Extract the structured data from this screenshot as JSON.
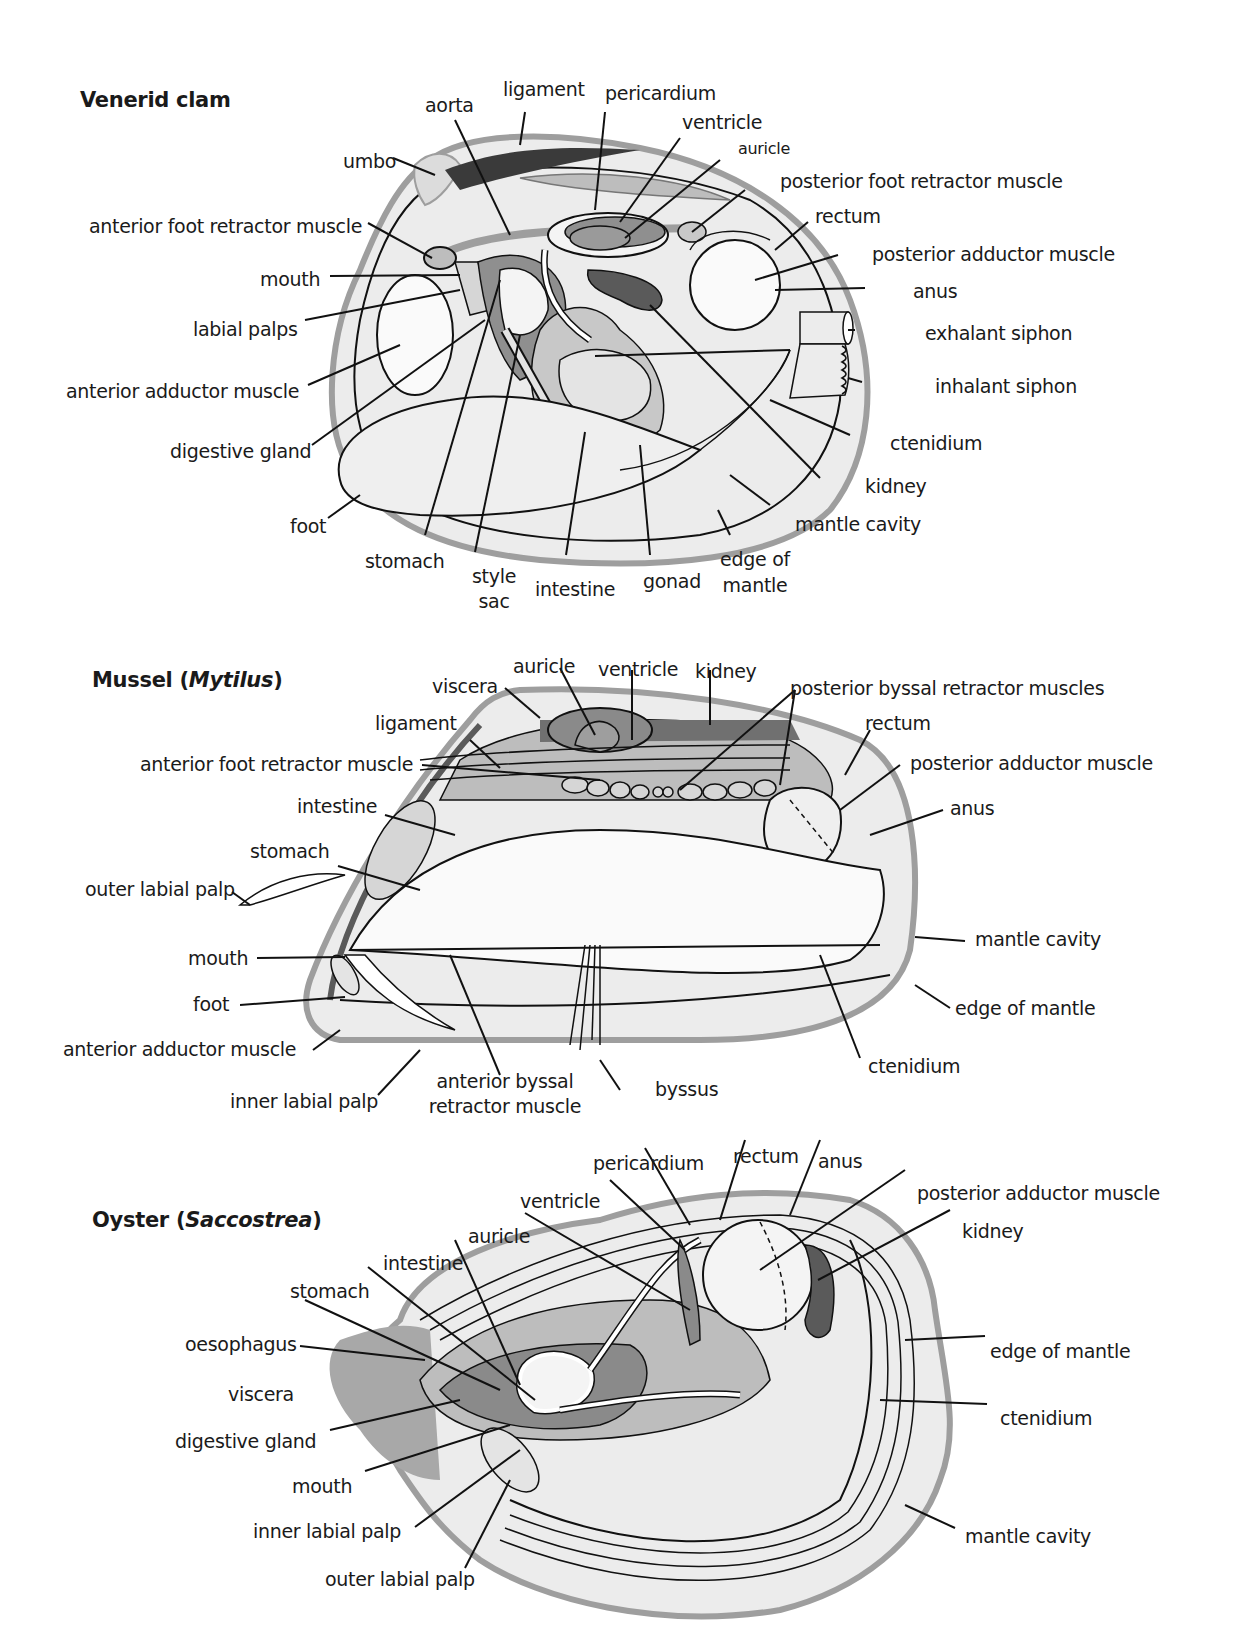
{
  "colors": {
    "shell_outer": "#9e9e9e",
    "shell_fill": "#ececec",
    "mid_grey": "#bdbdbd",
    "dark_grey": "#707070",
    "darkest": "#3a3a3a",
    "line": "#111111"
  },
  "clam": {
    "title": "Venerid clam",
    "labels": {
      "aorta": "aorta",
      "ligament": "ligament",
      "pericardium": "pericardium",
      "ventricle": "ventricle",
      "auricle": "auricle",
      "umbo": "umbo",
      "posterior_foot_retractor_muscle": "posterior foot retractor muscle",
      "anterior_foot_retractor_muscle": "anterior foot retractor muscle",
      "rectum": "rectum",
      "posterior_adductor_muscle": "posterior adductor muscle",
      "mouth": "mouth",
      "anus": "anus",
      "labial_palps": "labial palps",
      "exhalant_siphon": "exhalant siphon",
      "anterior_adductor_muscle": "anterior adductor muscle",
      "inhalant_siphon": "inhalant siphon",
      "ctenidium": "ctenidium",
      "digestive_gland": "digestive gland",
      "kidney": "kidney",
      "foot": "foot",
      "mantle_cavity": "mantle cavity",
      "stomach": "stomach",
      "style_sac_1": "style",
      "style_sac_2": "sac",
      "intestine": "intestine",
      "gonad": "gonad",
      "edge_of_mantle_1": "edge of",
      "edge_of_mantle_2": "mantle"
    }
  },
  "mussel": {
    "title_prefix": "Mussel (",
    "title_genus": "Mytilus",
    "title_suffix": ")",
    "labels": {
      "auricle": "auricle",
      "ventricle": "ventricle",
      "kidney": "kidney",
      "viscera": "viscera",
      "posterior_byssal_retractor_muscles": "posterior byssal retractor muscles",
      "ligament": "ligament",
      "rectum": "rectum",
      "anterior_foot_retractor_muscle": "anterior foot retractor muscle",
      "posterior_adductor_muscle": "posterior adductor muscle",
      "intestine": "intestine",
      "anus": "anus",
      "stomach": "stomach",
      "outer_labial_palp": "outer labial palp",
      "mantle_cavity": "mantle cavity",
      "mouth": "mouth",
      "foot": "foot",
      "edge_of_mantle": "edge of mantle",
      "anterior_adductor_muscle": "anterior adductor muscle",
      "ctenidium": "ctenidium",
      "anterior_byssal_1": "anterior byssal",
      "anterior_byssal_2": "retractor muscle",
      "byssus": "byssus",
      "inner_labial_palp": "inner labial palp"
    }
  },
  "oyster": {
    "title_prefix": "Oyster (",
    "title_genus": "Saccostrea",
    "title_suffix": ")",
    "labels": {
      "pericardium": "pericardium",
      "rectum": "rectum",
      "anus": "anus",
      "ventricle": "ventricle",
      "posterior_adductor_muscle": "posterior adductor muscle",
      "auricle": "auricle",
      "kidney": "kidney",
      "intestine": "intestine",
      "stomach": "stomach",
      "oesophagus": "oesophagus",
      "edge_of_mantle": "edge of mantle",
      "viscera": "viscera",
      "ctenidium": "ctenidium",
      "digestive_gland": "digestive gland",
      "mouth": "mouth",
      "inner_labial_palp": "inner labial palp",
      "mantle_cavity": "mantle cavity",
      "outer_labial_palp": "outer labial palp"
    }
  }
}
